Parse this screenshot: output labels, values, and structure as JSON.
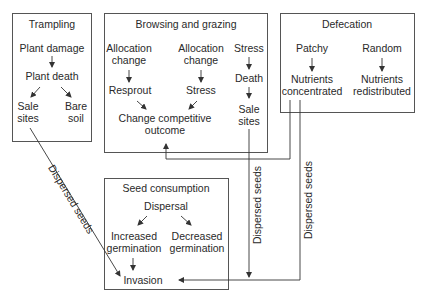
{
  "diagram": {
    "boxes": {
      "trampling": {
        "title": "Trampling",
        "nodes": {
          "plant_damage": "Plant damage",
          "plant_death": "Plant death",
          "sale_sites_1": "Sale",
          "sale_sites_2": "sites",
          "bare_soil_1": "Bare",
          "bare_soil_2": "soil"
        }
      },
      "browsing": {
        "title": "Browsing and grazing",
        "nodes": {
          "alloc1_1": "Allocation",
          "alloc1_2": "change",
          "alloc2_1": "Allocation",
          "alloc2_2": "change",
          "stress_top": "Stress",
          "resprout": "Resprout",
          "stress_mid": "Stress",
          "death": "Death",
          "sale_1": "Sale",
          "sale_2": "sites",
          "change_1": "Change competitive",
          "change_2": "outcome"
        }
      },
      "defecation": {
        "title": "Defecation",
        "nodes": {
          "patchy": "Patchy",
          "random": "Random",
          "conc_1": "Nutrients",
          "conc_2": "concentrated",
          "redist_1": "Nutrients",
          "redist_2": "redistributed"
        }
      },
      "seed": {
        "title": "Seed consumption",
        "nodes": {
          "dispersal": "Dispersal",
          "inc_1": "Increased",
          "inc_2": "germination",
          "dec_1": "Decreased",
          "dec_2": "germination",
          "invasion": "Invasion"
        }
      }
    },
    "connector_labels": {
      "diagonal": "Dispersed seeds",
      "vertical_middle": "Dispersed seeds",
      "vertical_right": "Dispersed seeds"
    },
    "colors": {
      "stroke": "#555555",
      "text": "#2a2a2a",
      "background": "#ffffff"
    }
  }
}
